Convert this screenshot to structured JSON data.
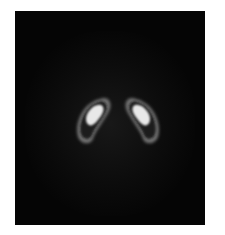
{
  "image": {
    "subject": "dopamine-transporter-spect-scan",
    "background_color": "#050505",
    "page_color": "#ffffff",
    "structures": [
      {
        "name": "left-striatum",
        "core_color": "#f2f2f2",
        "rim_color": "#8a8a8a"
      },
      {
        "name": "right-striatum",
        "core_color": "#f2f2f2",
        "rim_color": "#8a8a8a"
      }
    ]
  }
}
